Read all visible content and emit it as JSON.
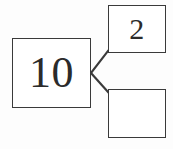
{
  "diagram": {
    "type": "number-bond",
    "stroke_color": "#3a3a3a",
    "text_color": "#2b2b2b",
    "background_color": "#fdfdfd",
    "whole": {
      "label": "10",
      "value": "10",
      "filled": "true"
    },
    "parts": [
      {
        "label": "2",
        "value": "2",
        "filled": "true",
        "position": "top-right"
      },
      {
        "label": "",
        "value": "",
        "filled": "false",
        "position": "bottom-right"
      }
    ],
    "connectors": [
      {
        "name": "whole-to-top-part",
        "from_x": 91,
        "from_y": 73,
        "to_x": 108,
        "to_y": 51
      },
      {
        "name": "whole-to-bottom-part",
        "from_x": 91,
        "from_y": 73,
        "to_x": 108,
        "to_y": 92
      }
    ]
  }
}
